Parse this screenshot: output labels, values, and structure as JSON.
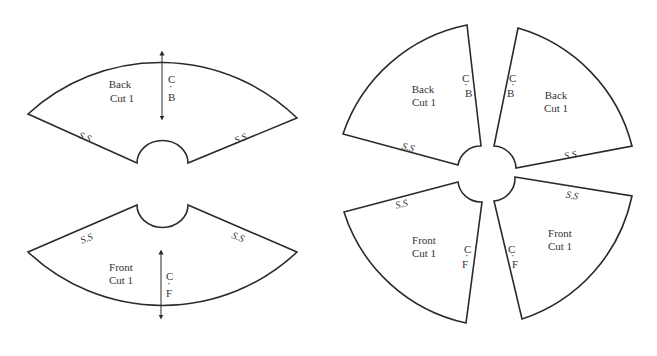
{
  "diagram": {
    "title": "",
    "layouts": [
      {
        "name": "two-piece",
        "pieces": [
          {
            "id": "back",
            "name_label": "Back",
            "cut_label": "Cut 1",
            "center_label_top": "C",
            "center_label_dot": "·",
            "center_label_bottom": "B",
            "side_seam_left": "S.S",
            "side_seam_right": "S.S"
          },
          {
            "id": "front",
            "name_label": "Front",
            "cut_label": "Cut 1",
            "center_label_top": "C",
            "center_label_dot": "·",
            "center_label_bottom": "F",
            "side_seam_left": "S.S",
            "side_seam_right": "S.S"
          }
        ]
      },
      {
        "name": "four-piece",
        "pieces": [
          {
            "id": "back-left",
            "name_label": "Back",
            "cut_label": "Cut 1",
            "center_label_top": "C",
            "center_label_dot": "·",
            "center_label_bottom": "B",
            "side_seam": "S.S"
          },
          {
            "id": "back-right",
            "name_label": "Back",
            "cut_label": "Cut 1",
            "center_label_top": "C",
            "center_label_dot": "·",
            "center_label_bottom": "B",
            "side_seam": "S.S"
          },
          {
            "id": "front-left",
            "name_label": "Front",
            "cut_label": "Cut 1",
            "center_label_top": "C",
            "center_label_dot": "·",
            "center_label_bottom": "F",
            "side_seam": "S.S"
          },
          {
            "id": "front-right",
            "name_label": "Front",
            "cut_label": "Cut 1",
            "center_label_top": "C",
            "center_label_dot": "·",
            "center_label_bottom": "F",
            "side_seam": "S.S"
          }
        ]
      }
    ]
  }
}
